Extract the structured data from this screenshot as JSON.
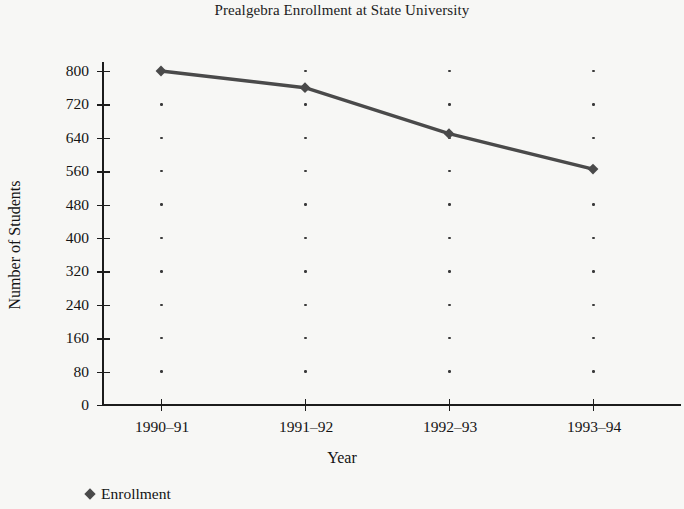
{
  "chart_data": {
    "type": "line",
    "title": "Prealgebra Enrollment at State University",
    "xlabel": "Year",
    "ylabel": "Number of Students",
    "categories": [
      "1990–91",
      "1991–92",
      "1992–93",
      "1993–94"
    ],
    "series": [
      {
        "name": "Enrollment",
        "values": [
          800,
          760,
          650,
          565
        ],
        "color": "#4a4a4a",
        "marker": "diamond"
      }
    ],
    "ylim": [
      0,
      800
    ],
    "ytick_values": [
      0,
      80,
      160,
      240,
      320,
      400,
      480,
      560,
      640,
      720,
      800
    ],
    "ytick_labels": [
      "0",
      "80",
      "160",
      "240",
      "320",
      "400",
      "480",
      "560",
      "640",
      "720",
      "800"
    ],
    "grid": "dotted-vertical-at-category-ticks",
    "legend_position": "bottom-left",
    "legend_entries": [
      "Enrollment"
    ],
    "axis_color": "#1c1c1c",
    "background_color": "#f7f7f5"
  }
}
